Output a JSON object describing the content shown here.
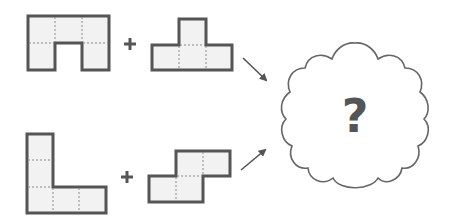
{
  "diagram": {
    "type": "pentomino-combination-puzzle",
    "colors": {
      "stroke": "#555555",
      "fill": "#f2f2f2",
      "dash": "#8a8a8a",
      "arrow": "#555555",
      "cloud_stroke": "#666666",
      "text": "#555555"
    },
    "rows": [
      {
        "left_piece": {
          "name": "U-shape",
          "cells": [
            [
              0,
              0
            ],
            [
              1,
              0
            ],
            [
              2,
              0
            ],
            [
              0,
              1
            ],
            [
              2,
              1
            ]
          ]
        },
        "operator": "+",
        "right_piece": {
          "name": "T-shape",
          "cells": [
            [
              1,
              0
            ],
            [
              0,
              1
            ],
            [
              1,
              1
            ],
            [
              2,
              1
            ]
          ]
        }
      },
      {
        "left_piece": {
          "name": "L-shape",
          "cells": [
            [
              0,
              0
            ],
            [
              0,
              1
            ],
            [
              0,
              2
            ],
            [
              1,
              2
            ],
            [
              2,
              2
            ]
          ]
        },
        "operator": "+",
        "right_piece": {
          "name": "S-shape",
          "cells": [
            [
              1,
              0
            ],
            [
              2,
              0
            ],
            [
              0,
              1
            ],
            [
              1,
              1
            ]
          ]
        }
      }
    ],
    "result": {
      "shape": "cloud",
      "label": "?"
    }
  }
}
